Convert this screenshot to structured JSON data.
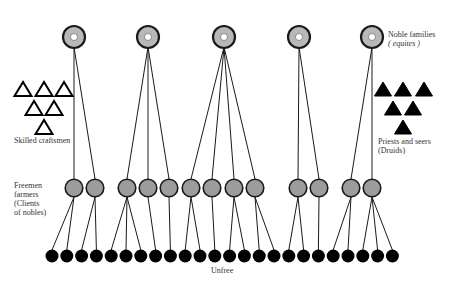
{
  "labels": {
    "nobles_line1": "Noble families",
    "nobles_line2": "( equites )",
    "craftsmen": "Skilled craftsmen",
    "priests_line1": "Priests and seers",
    "priests_line2": "(Druids)",
    "freemen_line1": "Freemen",
    "freemen_line2": "farmers",
    "freemen_line3": "(Clients",
    "freemen_line4": "of nobles)",
    "unfree": "Unfree"
  },
  "colors": {
    "noble_fill": "#b8b8b8",
    "freeman_fill": "#9c9c9c",
    "unfree_fill": "#000000",
    "stroke": "#1a1a1a"
  },
  "nobles": [
    {
      "x": 74,
      "y": 37,
      "freemen": [
        0,
        1
      ]
    },
    {
      "x": 148,
      "y": 37,
      "freemen": [
        2,
        3,
        4
      ]
    },
    {
      "x": 224,
      "y": 37,
      "freemen": [
        5,
        6,
        7,
        8
      ]
    },
    {
      "x": 299,
      "y": 37,
      "freemen": [
        9,
        10
      ]
    },
    {
      "x": 372,
      "y": 37,
      "freemen": [
        11,
        12
      ]
    }
  ],
  "freemen": [
    {
      "x": 74,
      "y": 188,
      "unfree": [
        0,
        1
      ]
    },
    {
      "x": 95,
      "y": 188,
      "unfree": [
        2,
        3
      ]
    },
    {
      "x": 127,
      "y": 188,
      "unfree": [
        4,
        5,
        6
      ]
    },
    {
      "x": 148,
      "y": 188,
      "unfree": [
        7
      ]
    },
    {
      "x": 169,
      "y": 188,
      "unfree": [
        8
      ]
    },
    {
      "x": 191,
      "y": 188,
      "unfree": [
        9,
        10
      ]
    },
    {
      "x": 212,
      "y": 188,
      "unfree": [
        11
      ]
    },
    {
      "x": 234,
      "y": 188,
      "unfree": [
        12,
        13
      ]
    },
    {
      "x": 255,
      "y": 188,
      "unfree": [
        14,
        15
      ]
    },
    {
      "x": 298,
      "y": 188,
      "unfree": [
        16,
        17
      ]
    },
    {
      "x": 319,
      "y": 188,
      "unfree": [
        18
      ]
    },
    {
      "x": 351,
      "y": 188,
      "unfree": [
        19,
        20
      ]
    },
    {
      "x": 372,
      "y": 188,
      "unfree": [
        21,
        22,
        23
      ]
    }
  ],
  "unfree": {
    "count": 24,
    "start_x": 52,
    "spacing": 14.8,
    "y": 256
  },
  "craftsmen_triangles": [
    {
      "x": 23,
      "y": 89
    },
    {
      "x": 44,
      "y": 89
    },
    {
      "x": 64,
      "y": 89
    },
    {
      "x": 34,
      "y": 108
    },
    {
      "x": 54,
      "y": 108
    },
    {
      "x": 44,
      "y": 127
    }
  ],
  "priest_triangles": [
    {
      "x": 383,
      "y": 89
    },
    {
      "x": 403,
      "y": 89
    },
    {
      "x": 424,
      "y": 89
    },
    {
      "x": 393,
      "y": 108
    },
    {
      "x": 413,
      "y": 108
    },
    {
      "x": 403,
      "y": 127
    }
  ]
}
